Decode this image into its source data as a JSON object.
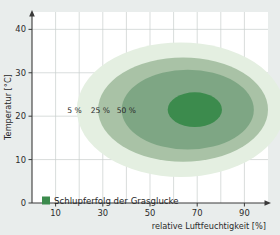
{
  "chart_data": {
    "type": "area",
    "title": "",
    "xlabel": "relative Luftfeuchtigkeit [%]",
    "ylabel": "Temperatur [°C]",
    "xlim": [
      0,
      100
    ],
    "ylim": [
      0,
      44
    ],
    "xticks": [
      "10",
      "30",
      "50",
      "70",
      "90"
    ],
    "xtick_values": [
      10,
      30,
      50,
      70,
      90
    ],
    "yticks": [
      "0",
      "10",
      "20",
      "30",
      "40"
    ],
    "ytick_values": [
      0,
      10,
      20,
      30,
      40
    ],
    "grid": true,
    "grid_x_step": 10,
    "grid_y_step": 10,
    "legend_position": "bottom-left",
    "legend": [
      {
        "label": "Schlupferfolg der Grasglucke",
        "color": "#3c8b4d"
      }
    ],
    "contours": [
      {
        "label": "5 %",
        "value": 5,
        "color": "#e4efe1",
        "center_x": 63,
        "center_y": 21.5,
        "radius_x": 44,
        "radius_y": 15.5,
        "label_x": 18,
        "label_y": 21.5
      },
      {
        "label": "25 %",
        "value": 25,
        "color": "#a9c2a6",
        "center_x": 64,
        "center_y": 21.5,
        "radius_x": 36,
        "radius_y": 12.0,
        "label_x": 29,
        "label_y": 21.5
      },
      {
        "label": "50 %",
        "value": 50,
        "color": "#7ea684",
        "center_x": 66,
        "center_y": 21.5,
        "radius_x": 28,
        "radius_y": 9.2,
        "label_x": 40,
        "label_y": 21.5
      },
      {
        "label": "",
        "value": 75,
        "color": "#3c8b4d",
        "center_x": 69,
        "center_y": 21.5,
        "radius_x": 11.5,
        "radius_y": 4.0,
        "label_x": null,
        "label_y": null
      }
    ]
  },
  "colors": {
    "page_background": "#e9edec",
    "plot_background": "#ffffff",
    "axis": "#3a3a3a",
    "grid": "#c9cfcd",
    "text": "#2b2b2b"
  }
}
